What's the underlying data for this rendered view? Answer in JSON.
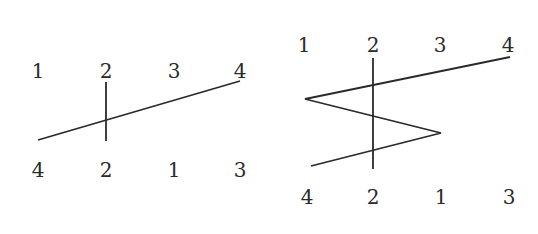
{
  "diagrams": [
    {
      "name": "left-diagram",
      "top_labels": [
        "1",
        "2",
        "3",
        "4"
      ],
      "bottom_labels": [
        "4",
        "2",
        "1",
        "3"
      ],
      "top_label_positions": [
        [
          38,
          71
        ],
        [
          106,
          71
        ],
        [
          174,
          71
        ],
        [
          240,
          71
        ]
      ],
      "bottom_label_positions": [
        [
          38,
          170
        ],
        [
          106,
          170
        ],
        [
          174,
          170
        ],
        [
          240,
          170
        ]
      ],
      "vertical_line": {
        "x": 106,
        "y1": 82,
        "y2": 141
      },
      "path": [
        [
          38,
          140
        ],
        [
          240,
          81
        ]
      ]
    },
    {
      "name": "right-diagram",
      "top_labels": [
        "1",
        "2",
        "3",
        "4"
      ],
      "bottom_labels": [
        "4",
        "2",
        "1",
        "3"
      ],
      "top_label_positions": [
        [
          304,
          45
        ],
        [
          373,
          45
        ],
        [
          440,
          45
        ],
        [
          508,
          45
        ]
      ],
      "bottom_label_positions": [
        [
          307,
          197
        ],
        [
          373,
          197
        ],
        [
          441,
          197
        ],
        [
          509,
          197
        ]
      ],
      "vertical_line": {
        "x": 373,
        "y1": 58,
        "y2": 169
      },
      "path": [
        [
          510,
          57
        ],
        [
          305,
          99
        ],
        [
          441,
          133
        ],
        [
          311,
          166
        ]
      ]
    }
  ],
  "colors": {
    "line": "#2a2a2a",
    "text": "#2a2a2a",
    "background": "#ffffff"
  }
}
